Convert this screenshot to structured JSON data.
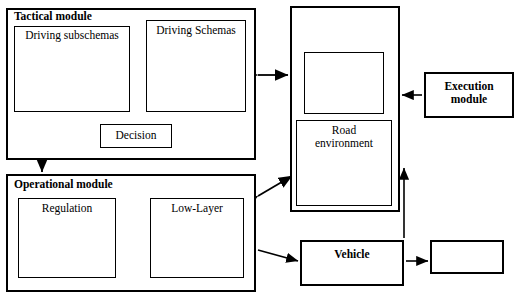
{
  "diagram": {
    "type": "block-diagram",
    "canvas": {
      "width": 520,
      "height": 298
    },
    "blocks": [
      {
        "id": "tactical",
        "label": "Tactical module",
        "x": 6,
        "y": 8,
        "w": 250,
        "h": 152,
        "bold": true,
        "label_pos": "top-left"
      },
      {
        "id": "driving_subschemas",
        "label": "Driving subschemas",
        "x": 14,
        "y": 26,
        "w": 116,
        "h": 86,
        "bold": false,
        "label_pos": "top"
      },
      {
        "id": "driving_schemas",
        "label": "Driving Schemas",
        "x": 146,
        "y": 20,
        "w": 100,
        "h": 92,
        "bold": false,
        "label_pos": "top"
      },
      {
        "id": "decision",
        "label": "Decision",
        "x": 100,
        "y": 124,
        "w": 72,
        "h": 24,
        "bold": false,
        "label_pos": "center"
      },
      {
        "id": "operational",
        "label": "Operational module",
        "x": 6,
        "y": 174,
        "w": 250,
        "h": 118,
        "bold": true,
        "label_pos": "top-left"
      },
      {
        "id": "regulation",
        "label": "Regulation",
        "x": 18,
        "y": 198,
        "w": 98,
        "h": 80,
        "bold": false,
        "label_pos": "top"
      },
      {
        "id": "low_layer",
        "label": "Low-Layer",
        "x": 150,
        "y": 198,
        "w": 94,
        "h": 80,
        "bold": false,
        "label_pos": "top"
      },
      {
        "id": "perception",
        "label": "Perception\nmodule",
        "x": 290,
        "y": 6,
        "w": 110,
        "h": 206,
        "bold": true,
        "label_pos": "top"
      },
      {
        "id": "visual_field",
        "label": "",
        "x": 304,
        "y": 52,
        "w": 80,
        "h": 62,
        "bold": false,
        "label_pos": "none"
      },
      {
        "id": "visual_attention",
        "label": "Visual attention\nallocation",
        "x": 296,
        "y": 120,
        "w": 96,
        "h": 86,
        "bold": false,
        "label_pos": "top"
      },
      {
        "id": "road_env",
        "label": "Road\nenvironment",
        "x": 424,
        "y": 72,
        "w": 90,
        "h": 46,
        "bold": true,
        "label_pos": "center"
      },
      {
        "id": "execution",
        "label": "Execution\nmodule",
        "x": 300,
        "y": 240,
        "w": 104,
        "h": 46,
        "bold": true,
        "label_pos": "center"
      },
      {
        "id": "vehicle",
        "label": "Vehicle",
        "x": 430,
        "y": 240,
        "w": 74,
        "h": 34,
        "bold": true,
        "label_pos": "center"
      }
    ],
    "node_clusters": [
      {
        "id": "cluster-driving-subschemas",
        "parent": "driving_subschemas"
      },
      {
        "id": "cluster-driving-schemas",
        "parent": "driving_schemas"
      },
      {
        "id": "cluster-regulation",
        "parent": "regulation"
      },
      {
        "id": "cluster-low-layer",
        "parent": "low_layer"
      },
      {
        "id": "cluster-visual-attention",
        "parent": "visual_attention"
      }
    ],
    "connectors": [
      {
        "from": "driving_subschemas",
        "to": "driving_schemas",
        "style": "double-arrow"
      },
      {
        "from": "driving_subschemas",
        "to": "decision",
        "style": "single-arrow"
      },
      {
        "from": "driving_schemas",
        "to": "decision",
        "style": "single-arrow"
      },
      {
        "from": "tactical",
        "to": "perception",
        "style": "double-arrow"
      },
      {
        "from": "tactical",
        "to": "operational",
        "style": "double-arrow"
      },
      {
        "from": "regulation",
        "to": "low_layer",
        "style": "double-arrow"
      },
      {
        "from": "operational",
        "to": "perception",
        "style": "double-arrow"
      },
      {
        "from": "operational",
        "to": "execution",
        "style": "single-arrow"
      },
      {
        "from": "execution",
        "to": "vehicle",
        "style": "single-arrow"
      },
      {
        "from": "vehicle",
        "to": "perception",
        "style": "single-arrow"
      },
      {
        "from": "road_env",
        "to": "perception",
        "style": "single-arrow"
      }
    ],
    "colors": {
      "stroke": "#000000",
      "fill": "#ffffff"
    }
  }
}
